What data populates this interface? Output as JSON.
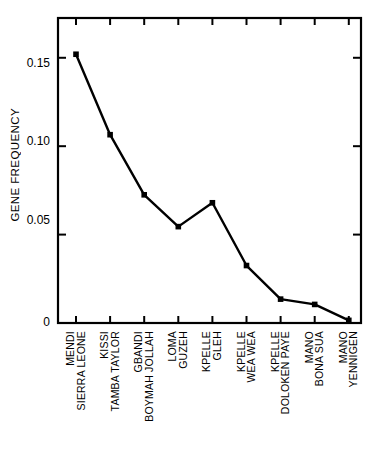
{
  "chart_data": {
    "type": "line",
    "title": "",
    "subtitle": "",
    "xlabel": "",
    "ylabel": "GENE FREQUENCY",
    "ylim": [
      0,
      0.1725
    ],
    "yticks": [
      0,
      0.05,
      0.1,
      0.15
    ],
    "ytick_labels": [
      "0",
      "0.05",
      "0.10",
      "0.15"
    ],
    "grid": false,
    "legend": "none",
    "marker": "filled-square",
    "line_color": "#000000",
    "categories": [
      "MENDI SIERRA LEONE",
      "KISSI TAMBA TAYLOR",
      "GBANDI BOYMAH JOLLAH",
      "LOMA GUZEH",
      "KPELLE GLEH",
      "KPELLE WEA WEA",
      "KPELLE DOLOKEN PAYE",
      "MANO BONA SUA",
      "MANO YENNIGEN"
    ],
    "category_lines": [
      [
        "MENDI",
        "SIERRA LEONE"
      ],
      [
        "KISSI",
        "TAMBA TAYLOR"
      ],
      [
        "GBANDI",
        "BOYMAH JOLLAH"
      ],
      [
        "LOMA",
        "GUZEH"
      ],
      [
        "KPELLE",
        "GLEH"
      ],
      [
        "KPELLE",
        "WEA WEA"
      ],
      [
        "KPELLE",
        "DOLOKEN PAYE"
      ],
      [
        "MANO",
        "BONA SUA"
      ],
      [
        "MANO",
        "YENNIGEN"
      ]
    ],
    "values": [
      0.152,
      0.1065,
      0.0725,
      0.0545,
      0.068,
      0.0325,
      0.0135,
      0.0105,
      0.0015
    ],
    "series": [
      {
        "name": "Gene frequency",
        "values": [
          0.152,
          0.1065,
          0.0725,
          0.0545,
          0.068,
          0.0325,
          0.0135,
          0.0105,
          0.0015
        ]
      }
    ],
    "axis": {
      "frame": "box",
      "ticks_top": 9,
      "ticks_bottom": 9,
      "ticks_left": 3,
      "ticks_right": 3,
      "tick_direction": "inward"
    }
  },
  "ylabel_text": "GENE FREQUENCY"
}
